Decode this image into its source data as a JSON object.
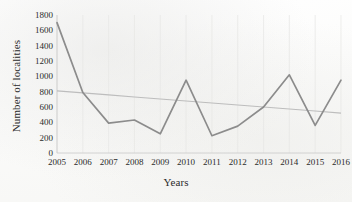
{
  "chart_data": {
    "type": "line",
    "title": "",
    "xlabel": "Years",
    "ylabel": "Number of localities",
    "categories": [
      "2005",
      "2006",
      "2007",
      "2008",
      "2009",
      "2010",
      "2011",
      "2012",
      "2013",
      "2014",
      "2015",
      "2016"
    ],
    "series": [
      {
        "name": "Number of localities",
        "color": "#8c8c8c",
        "values": [
          1700,
          790,
          390,
          430,
          250,
          950,
          225,
          350,
          600,
          1020,
          360,
          950
        ]
      },
      {
        "name": "Linear trendline",
        "color": "#bdbdbd",
        "values": [
          810,
          784,
          758,
          731,
          705,
          679,
          652,
          626,
          600,
          573,
          547,
          520
        ]
      }
    ],
    "ylim": [
      0,
      1800
    ],
    "ytick_labels": [
      "0",
      "200",
      "400",
      "600",
      "800",
      "1000",
      "1200",
      "1400",
      "1600",
      "1800"
    ],
    "ytick_values": [
      0,
      200,
      400,
      600,
      800,
      1000,
      1200,
      1400,
      1600,
      1800
    ],
    "xtick_labels": [
      "2005",
      "2006",
      "2007",
      "2008",
      "2009",
      "2010",
      "2011",
      "2012",
      "2013",
      "2014",
      "2015",
      "2016"
    ],
    "grid": "vertical-light",
    "legend": "none"
  }
}
